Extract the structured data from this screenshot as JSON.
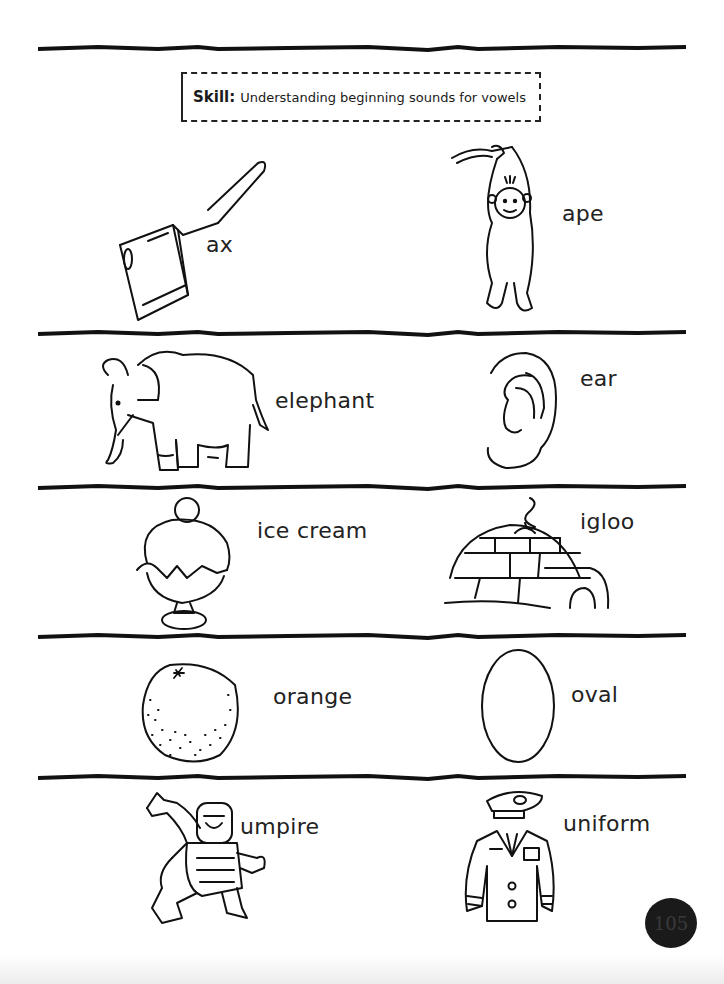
{
  "skill": {
    "label": "Skill:",
    "text": "Understanding beginning sounds for vowels"
  },
  "rows": [
    {
      "left": {
        "word": "ax",
        "icon": "axe-icon"
      },
      "right": {
        "word": "ape",
        "icon": "ape-icon"
      }
    },
    {
      "left": {
        "word": "elephant",
        "icon": "elephant-icon"
      },
      "right": {
        "word": "ear",
        "icon": "ear-icon"
      }
    },
    {
      "left": {
        "word": "ice cream",
        "icon": "ice-cream-icon"
      },
      "right": {
        "word": "igloo",
        "icon": "igloo-icon"
      }
    },
    {
      "left": {
        "word": "orange",
        "icon": "orange-icon"
      },
      "right": {
        "word": "oval",
        "icon": "oval-icon"
      }
    },
    {
      "left": {
        "word": "umpire",
        "icon": "umpire-icon"
      },
      "right": {
        "word": "uniform",
        "icon": "uniform-icon"
      }
    }
  ],
  "page_number": "105",
  "colors": {
    "ink": "#111111",
    "paper": "#ffffff"
  }
}
